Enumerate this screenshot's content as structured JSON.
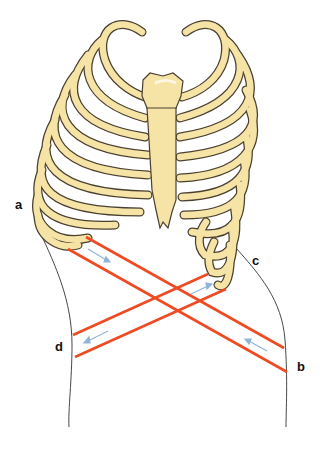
{
  "diagram": {
    "labels": {
      "a": "a",
      "b": "b",
      "c": "c",
      "d": "d"
    },
    "colors": {
      "bone_fill": "#f6e3a6",
      "bone_outline": "#4a4030",
      "muscle_line": "#ef4b22",
      "arrow": "#8fb4dc",
      "body_outline": "#333333"
    }
  }
}
